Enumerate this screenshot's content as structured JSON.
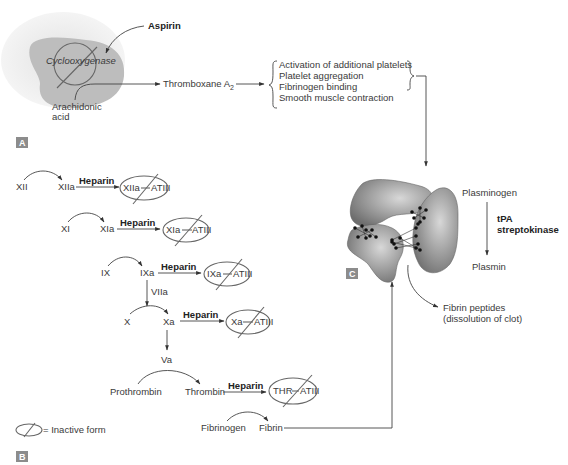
{
  "panel_a": {
    "badge": "A",
    "aspirin": "Aspirin",
    "enzyme": "Cyclooxygenase",
    "substrate_line1": "Arachidonic",
    "substrate_line2": "acid",
    "product": "Thromboxane A",
    "product_sub": "2",
    "effects": [
      "Activation of additional platelets",
      "Platelet aggregation",
      "Fibrinogen binding",
      "Smooth muscle contraction"
    ]
  },
  "panel_b": {
    "badge": "B",
    "inhibitor": "Heparin",
    "rows": [
      {
        "from": "XII",
        "to": "XIIa",
        "complex_left": "XIIa",
        "complex_right": "ATIII"
      },
      {
        "from": "XI",
        "to": "XIa",
        "complex_left": "XIa",
        "complex_right": "ATIII"
      },
      {
        "from": "IX",
        "to": "IXa",
        "complex_left": "IXa",
        "complex_right": "ATIII"
      },
      {
        "from": "X",
        "to": "Xa",
        "complex_left": "Xa",
        "complex_right": "ATIII"
      },
      {
        "from": "Prothrombin",
        "to": "Thrombin",
        "complex_left": "THR",
        "complex_right": "ATIII"
      }
    ],
    "cofactor_1": "VIIa",
    "cofactor_2": "Va",
    "fibrinogen": "Fibrinogen",
    "fibrin": "Fibrin",
    "legend": "= Inactive form"
  },
  "panel_c": {
    "badge": "C",
    "plasminogen": "Plasminogen",
    "activator_1": "tPA",
    "activator_2": "streptokinase",
    "plasmin": "Plasmin",
    "peptides_line1": "Fibrin peptides",
    "peptides_line2": "(dissolution of clot)"
  },
  "colors": {
    "cell_outer": "#ececec",
    "cell_inner": "#bdbdbd",
    "clot": "#8a8a8a",
    "badge": "#8c8c8c"
  }
}
